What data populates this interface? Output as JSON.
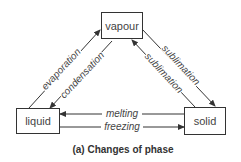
{
  "nodes": {
    "vapour": "vapour",
    "liquid": "liquid",
    "solid": "solid"
  },
  "edges": {
    "evaporation": "evaporation",
    "condensation": "condensation",
    "sublimation_to_solid": "sublimation",
    "sublimation_to_vapour": "sublimation",
    "melting": "melting",
    "freezing": "freezing"
  },
  "caption": "(a) Changes of phase"
}
